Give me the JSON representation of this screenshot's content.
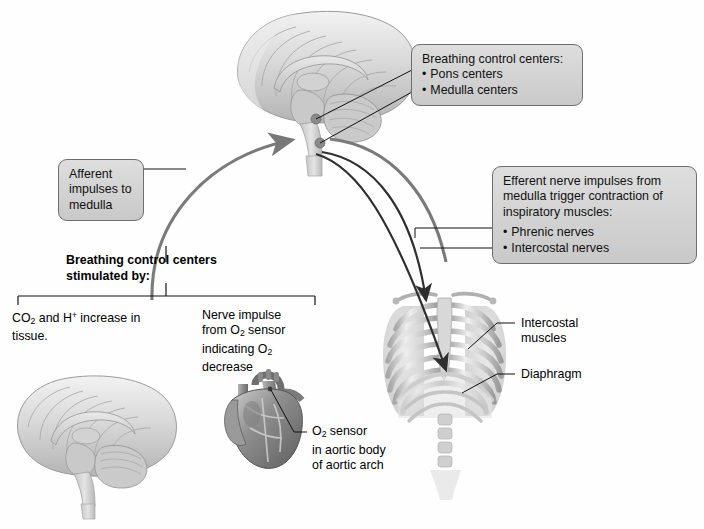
{
  "figure": {
    "title_implied": "Regulation of breathing by respiratory control centers",
    "colors": {
      "box_fill": "#d4d4d4",
      "box_border": "#6e6e6e",
      "arrow_gray": "#7a7a7a",
      "arrow_dark": "#2b2b2b",
      "leader_line": "#111111",
      "dot_gray": "#8a8a8a"
    }
  },
  "callouts": {
    "breathing_control_centers": {
      "heading": "Breathing control centers:",
      "items": [
        "Pons centers",
        "Medulla centers"
      ]
    },
    "afferent": {
      "lines": [
        "Afferent",
        "impulses to",
        "medulla"
      ]
    },
    "efferent": {
      "lines": [
        "Efferent nerve impulses from",
        "medulla trigger contraction of",
        "inspiratory muscles:"
      ],
      "items": [
        "Phrenic nerves",
        "Intercostal nerves"
      ]
    }
  },
  "bracket_heading": {
    "line1": "Breathing control centers",
    "line2": "stimulated by:"
  },
  "stimuli": {
    "left": {
      "line1_pre": "CO",
      "line1_sub": "2",
      "line1_mid": " and H",
      "line1_sup": "+",
      "line1_post": " increase in",
      "line2": "tissue."
    },
    "right": {
      "line1": "Nerve impulse",
      "line2_pre": "from O",
      "line2_sub": "2",
      "line2_post": " sensor",
      "line3_pre": "indicating O",
      "line3_sub": "2",
      "line4": "decrease"
    }
  },
  "anatomy_labels": {
    "intercostal": {
      "line1": "Intercostal",
      "line2": "muscles"
    },
    "diaphragm": {
      "line1": "Diaphragm"
    },
    "o2_sensor": {
      "line1_pre": "O",
      "line1_sub": "2",
      "line1_post": " sensor",
      "line2": "in aortic body",
      "line3": "of aortic arch"
    }
  },
  "illustrations": {
    "brain_top": "mid-sagittal-brain-section",
    "brain_bottom_left": "mid-sagittal-brain-section",
    "heart": "anterior-heart-with-aortic-arch",
    "thorax": "anterior-ribcage-with-diaphragm"
  }
}
